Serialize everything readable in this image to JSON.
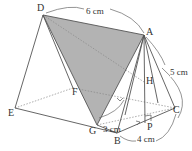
{
  "diagram": {
    "type": "triangular-prism-geometry",
    "points": {
      "D": {
        "label": "D",
        "x": 40,
        "y": 12
      },
      "A": {
        "label": "A",
        "x": 144,
        "y": 35
      },
      "H": {
        "label": "H",
        "x": 146,
        "y": 82
      },
      "C": {
        "label": "C",
        "x": 175,
        "y": 112
      },
      "F": {
        "label": "F",
        "x": 73,
        "y": 87
      },
      "G": {
        "label": "G",
        "x": 97,
        "y": 127
      },
      "E": {
        "label": "E",
        "x": 12,
        "y": 109
      },
      "B": {
        "label": "B",
        "x": 117,
        "y": 134
      },
      "P": {
        "label": "P",
        "x": 148,
        "y": 125
      }
    },
    "measurements": {
      "DA": "6 cm",
      "AC": "5 cm",
      "GH": "3 cm",
      "BC": "4 cm"
    },
    "colors": {
      "line": "#555555",
      "dashed": "#888888",
      "shade": "#b3b3b3",
      "text": "#333333"
    }
  }
}
